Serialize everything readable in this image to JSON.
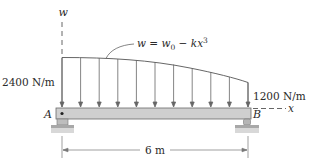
{
  "figure": {
    "type": "simply supported beam with distributed load",
    "axis_w_label": "w",
    "axis_x_label": "x",
    "load_equation": {
      "lhs": "w",
      "eq": " = ",
      "w0_base": "w",
      "w0_sub": "0",
      "minus": " − ",
      "k": "k",
      "x": "x",
      "power": "3"
    },
    "left_intensity": "2400 N/m",
    "right_intensity": "1200 N/m",
    "support_left_label": "A",
    "support_right_label": "B",
    "span_label": "6 m",
    "arrow_count": 11,
    "colors": {
      "line": "#555555",
      "beam_fill": "#cfcfcf",
      "beam_stroke": "#6a6a6a",
      "ground": "#a8a8a8",
      "text": "#2a2a2a"
    }
  }
}
